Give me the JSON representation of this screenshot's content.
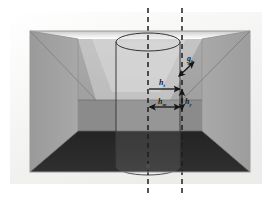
{
  "figure": {
    "canvas": {
      "width": 276,
      "height": 203
    },
    "background_color": "#ffffff"
  },
  "frame": {
    "name": "image-frame",
    "outer_margin_color": "#f2f2f0",
    "inner_rect": {
      "x": 30,
      "y": 31,
      "width": 220,
      "height": 141
    },
    "border_color": "#9a9a9a"
  },
  "scene": {
    "back_wall": {
      "label": "back-wall",
      "color_top": "#a8a8a8",
      "color_bottom": "#9b9b9b",
      "rect": {
        "x": 78,
        "y": 39,
        "width": 124,
        "height": 92
      }
    },
    "left_wall": {
      "label": "left-wall",
      "color": "#a0a0a0"
    },
    "right_wall": {
      "label": "right-wall",
      "color": "#a3a3a3"
    },
    "ceiling": {
      "label": "ceiling",
      "color_near": "#ffffff",
      "color_far": "#d2d2d2"
    },
    "floor": {
      "label": "floor",
      "color": "#2b2b2b"
    },
    "horizon_line": {
      "label": "horizon",
      "y": 100,
      "color": "#6e6e6e"
    },
    "lower_back_band": {
      "label": "lower-back-wall-band",
      "color": "#8a8a8a"
    }
  },
  "cylinder": {
    "name": "cylinder-object",
    "center_x": 148,
    "top_y": 42,
    "bottom_y": 166,
    "radius_x": 32,
    "radius_y": 9,
    "outline_color": "#3a3a3a",
    "body_fill": "none"
  },
  "dashed_lines": [
    {
      "name": "dashed-line-cylinder-axis",
      "x": 148,
      "y1": 8,
      "y2": 196,
      "color": "#1e1e1e",
      "dash": "5,4"
    },
    {
      "name": "dashed-line-corner-axis",
      "x": 182,
      "y1": 8,
      "y2": 196,
      "color": "#1e1e1e",
      "dash": "5,4"
    }
  ],
  "annotations": {
    "arrows": [
      {
        "name": "arrow-h-t",
        "type": "single-headed-horizontal",
        "from": {
          "x": 149,
          "y": 89
        },
        "to": {
          "x": 181,
          "y": 89
        },
        "label": "h",
        "subscript": "t",
        "label_x": 161,
        "label_y": 84
      },
      {
        "name": "arrow-h-m",
        "type": "double-headed-horizontal",
        "from": {
          "x": 149,
          "y": 107
        },
        "to": {
          "x": 181,
          "y": 107
        },
        "label": "h",
        "subscript": "m",
        "label_x": 160,
        "label_y": 103
      },
      {
        "name": "arrow-g-b",
        "type": "double-headed-diagonal",
        "from": {
          "x": 178,
          "y": 75
        },
        "to": {
          "x": 193,
          "y": 62
        },
        "label": "g",
        "subscript": "b",
        "label_x": 189,
        "label_y": 62
      },
      {
        "name": "arrow-h-y",
        "type": "double-headed-vertical",
        "from": {
          "x": 182,
          "y": 89
        },
        "to": {
          "x": 182,
          "y": 111
        },
        "label": "h",
        "subscript": "y",
        "label_x": 186,
        "label_y": 103
      }
    ],
    "arrow_color": "#151515"
  }
}
